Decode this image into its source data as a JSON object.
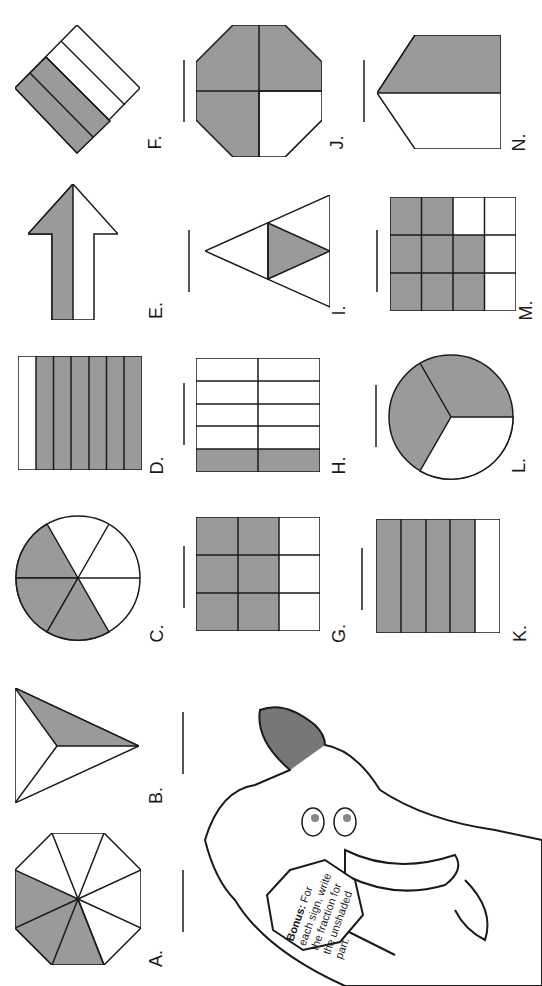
{
  "worksheet": {
    "orientation_note": "Page content is rotated 90 degrees; labels read bottom-to-top.",
    "colors": {
      "shaded": "#9a9a9a",
      "stroke": "#1a1a1a",
      "background": "#ffffff"
    },
    "items": [
      {
        "id": "F",
        "label": "F.",
        "shape": "diamond-stripes",
        "parts": 4,
        "shaded": 2
      },
      {
        "id": "J",
        "label": "J.",
        "shape": "octagon-quarters",
        "parts": 4,
        "shaded": 3
      },
      {
        "id": "N",
        "label": "N.",
        "shape": "pentagon-halves",
        "parts": 2,
        "shaded": 1
      },
      {
        "id": "E",
        "label": "E.",
        "shape": "arrow-halves",
        "parts": 2,
        "shaded": 1
      },
      {
        "id": "I",
        "label": "I.",
        "shape": "triangle-fourths",
        "parts": 4,
        "shaded": 1
      },
      {
        "id": "M",
        "label": "M.",
        "shape": "grid-4x3",
        "parts": 12,
        "shaded": 8
      },
      {
        "id": "D",
        "label": "D.",
        "shape": "rect-stripes",
        "parts": 7,
        "shaded": 6
      },
      {
        "id": "H",
        "label": "H.",
        "shape": "grid-2x5",
        "parts": 10,
        "shaded": 2
      },
      {
        "id": "L",
        "label": "L.",
        "shape": "circle-thirds",
        "parts": 3,
        "shaded": 2
      },
      {
        "id": "C",
        "label": "C.",
        "shape": "circle-sixths",
        "parts": 6,
        "shaded": 3
      },
      {
        "id": "G",
        "label": "G.",
        "shape": "grid-3x3",
        "parts": 9,
        "shaded": 6
      },
      {
        "id": "K",
        "label": "K.",
        "shape": "rect-stripes",
        "parts": 5,
        "shaded": 4
      },
      {
        "id": "B",
        "label": "B.",
        "shape": "triangle-thirds",
        "parts": 3,
        "shaded": 1
      },
      {
        "id": "A",
        "label": "A.",
        "shape": "octagon-eighths",
        "parts": 8,
        "shaded": 3
      }
    ],
    "sign": {
      "bold_lead": "Bonus:",
      "lines": [
        "For",
        "each sign, write",
        "the fraction for",
        "the unshaded",
        "part."
      ]
    }
  }
}
